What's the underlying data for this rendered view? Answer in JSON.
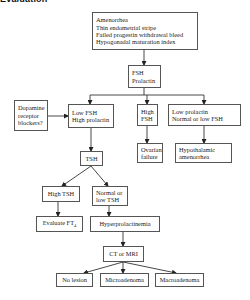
{
  "title": "Evaluation",
  "colors": {
    "line": "#333333",
    "box_border": "#555555",
    "text": "#222222",
    "background": "#ffffff"
  },
  "nodes": {
    "start": {
      "lines": [
        "Amenorrhea",
        "Thin endometrial stripe",
        "Failed progestin withdrawal bleed",
        "Hypogonadal maturation index"
      ]
    },
    "fsh_prolactin": {
      "lines": [
        "FSH",
        "Prolactin"
      ]
    },
    "dopamine": {
      "lines": [
        "Dopamine",
        "receptor",
        "blockers?"
      ]
    },
    "low_fsh_high_prl": {
      "lines": [
        "Low FSH",
        "High prolactin"
      ]
    },
    "high_fsh": {
      "lines": [
        "High",
        "FSH"
      ]
    },
    "low_prl_normal_fsh": {
      "lines": [
        "Low prolactin",
        "Normal or low FSH"
      ]
    },
    "ovarian_failure": {
      "lines": [
        "Ovarian",
        "failure"
      ]
    },
    "hypothalamic": {
      "lines": [
        "Hypothalamic",
        "amenorrhea"
      ]
    },
    "tsh": {
      "lines": [
        "TSH"
      ]
    },
    "high_tsh": {
      "lines": [
        "High TSH"
      ]
    },
    "normal_low_tsh": {
      "lines": [
        "Normal or",
        "low TSH"
      ]
    },
    "evaluate_ft4": {
      "label": "Evaluate FT",
      "subscript": "4"
    },
    "hyperprolactinemia": {
      "lines": [
        "Hyperprolactinemia"
      ]
    },
    "ct_mri": {
      "lines": [
        "CT or MRI"
      ]
    },
    "no_lesion": {
      "lines": [
        "No lesion"
      ]
    },
    "microadenoma": {
      "lines": [
        "Microadenoma"
      ]
    },
    "macroadenoma": {
      "lines": [
        "Macroadenoma"
      ]
    }
  },
  "edges": [
    [
      "start",
      "fsh_prolactin"
    ],
    [
      "fsh_prolactin",
      "low_fsh_high_prl"
    ],
    [
      "fsh_prolactin",
      "high_fsh"
    ],
    [
      "fsh_prolactin",
      "low_prl_normal_fsh"
    ],
    [
      "dopamine",
      "low_fsh_high_prl"
    ],
    [
      "low_fsh_high_prl",
      "tsh"
    ],
    [
      "high_fsh",
      "ovarian_failure"
    ],
    [
      "low_prl_normal_fsh",
      "hypothalamic"
    ],
    [
      "tsh",
      "high_tsh"
    ],
    [
      "tsh",
      "normal_low_tsh"
    ],
    [
      "high_tsh",
      "evaluate_ft4"
    ],
    [
      "normal_low_tsh",
      "hyperprolactinemia"
    ],
    [
      "hyperprolactinemia",
      "ct_mri"
    ],
    [
      "ct_mri",
      "no_lesion"
    ],
    [
      "ct_mri",
      "microadenoma"
    ],
    [
      "ct_mri",
      "macroadenoma"
    ]
  ]
}
